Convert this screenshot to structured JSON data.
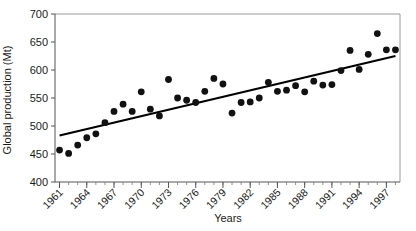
{
  "chart_data": {
    "type": "scatter",
    "title": "",
    "xlabel": "Years",
    "ylabel": "Global production (Mt)",
    "xlim": [
      1960.5,
      1998.5
    ],
    "ylim": [
      400,
      700
    ],
    "ytick_values": [
      400,
      450,
      500,
      550,
      600,
      650,
      700
    ],
    "ytick_labels": [
      "400",
      "450",
      "500",
      "550",
      "600",
      "650",
      "700"
    ],
    "xtick_values": [
      1961,
      1964,
      1967,
      1970,
      1973,
      1976,
      1979,
      1982,
      1985,
      1988,
      1991,
      1994,
      1997
    ],
    "xtick_labels": [
      "1961",
      "1964",
      "1967",
      "1970",
      "1973",
      "1976",
      "1979",
      "1982",
      "1985",
      "1988",
      "1991",
      "1994",
      "1997"
    ],
    "xtick_minor_step": 1,
    "grid": false,
    "legend": null,
    "marker_style": "filled-circle",
    "marker_color": "#111111",
    "trendline": {
      "type": "linear",
      "color": "#000000",
      "x_start": 1961,
      "y_start": 483,
      "x_end": 1998,
      "y_end": 625
    },
    "x": [
      1961,
      1962,
      1963,
      1964,
      1965,
      1966,
      1967,
      1968,
      1969,
      1970,
      1971,
      1972,
      1973,
      1974,
      1975,
      1976,
      1977,
      1978,
      1979,
      1980,
      1981,
      1982,
      1983,
      1984,
      1985,
      1986,
      1987,
      1988,
      1989,
      1990,
      1991,
      1992,
      1993,
      1994,
      1995,
      1996,
      1997,
      1998
    ],
    "values": [
      457,
      451,
      466,
      479,
      486,
      506,
      526,
      539,
      526,
      561,
      530,
      518,
      583,
      550,
      546,
      542,
      562,
      585,
      575,
      523,
      542,
      543,
      550,
      578,
      562,
      564,
      572,
      561,
      580,
      573,
      574,
      599,
      635,
      601,
      628,
      665,
      636,
      636
    ],
    "series": [
      {
        "name": "Global production",
        "units": "Mt",
        "points": [
          {
            "x": 1961,
            "y": 457
          },
          {
            "x": 1962,
            "y": 451
          },
          {
            "x": 1963,
            "y": 466
          },
          {
            "x": 1964,
            "y": 479
          },
          {
            "x": 1965,
            "y": 486
          },
          {
            "x": 1966,
            "y": 506
          },
          {
            "x": 1967,
            "y": 526
          },
          {
            "x": 1968,
            "y": 539
          },
          {
            "x": 1969,
            "y": 526
          },
          {
            "x": 1970,
            "y": 561
          },
          {
            "x": 1971,
            "y": 530
          },
          {
            "x": 1972,
            "y": 518
          },
          {
            "x": 1973,
            "y": 583
          },
          {
            "x": 1974,
            "y": 550
          },
          {
            "x": 1975,
            "y": 546
          },
          {
            "x": 1976,
            "y": 542
          },
          {
            "x": 1977,
            "y": 562
          },
          {
            "x": 1978,
            "y": 585
          },
          {
            "x": 1979,
            "y": 575
          },
          {
            "x": 1980,
            "y": 523
          },
          {
            "x": 1981,
            "y": 542
          },
          {
            "x": 1982,
            "y": 543
          },
          {
            "x": 1983,
            "y": 550
          },
          {
            "x": 1984,
            "y": 578
          },
          {
            "x": 1985,
            "y": 562
          },
          {
            "x": 1986,
            "y": 564
          },
          {
            "x": 1987,
            "y": 572
          },
          {
            "x": 1988,
            "y": 561
          },
          {
            "x": 1989,
            "y": 580
          },
          {
            "x": 1990,
            "y": 573
          },
          {
            "x": 1991,
            "y": 574
          },
          {
            "x": 1992,
            "y": 599
          },
          {
            "x": 1993,
            "y": 635
          },
          {
            "x": 1994,
            "y": 601
          },
          {
            "x": 1995,
            "y": 628
          },
          {
            "x": 1996,
            "y": 665
          },
          {
            "x": 1997,
            "y": 636
          },
          {
            "x": 1998,
            "y": 636
          }
        ]
      }
    ]
  }
}
